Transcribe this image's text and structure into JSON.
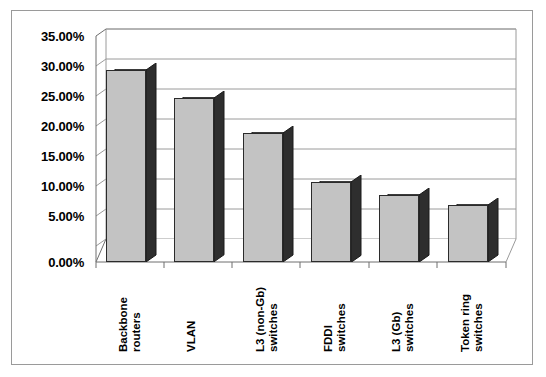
{
  "chart_data": {
    "type": "bar",
    "title": "",
    "xlabel": "",
    "ylabel": "",
    "categories": [
      "Backbone\nrouters",
      "VLAN",
      "L3 (non-Gb)\nswitches",
      "FDDI\nswitches",
      "L3 (Gb)\nswitches",
      "Token ring\nswitches"
    ],
    "values": [
      0.32,
      0.273,
      0.215,
      0.134,
      0.112,
      0.095
    ],
    "value_labels": [
      "32.00%",
      "27.30%",
      "21.50%",
      "13.40%",
      "11.20%",
      "9.50%"
    ],
    "ylim": [
      0,
      0.35
    ],
    "ytick_labels": [
      "35.00%",
      "30.00%",
      "25.00%",
      "20.00%",
      "15.00%",
      "10.00%",
      "5.00%",
      "0.00%"
    ],
    "ytick_values": [
      0.35,
      0.3,
      0.25,
      0.2,
      0.15,
      0.1,
      0.05,
      0.0
    ],
    "grid": true,
    "legend": "none",
    "style": "3d-column",
    "colors": {
      "bar_front": "#c3c3c3",
      "bar_side": "#2e2e2e",
      "bar_top": "#5c5c5c",
      "grid_line": "#9a9a9a",
      "axis_line": "#6e6e6e",
      "frame_border": "#9a9a9a",
      "background": "#ffffff",
      "text": "#000000"
    }
  }
}
